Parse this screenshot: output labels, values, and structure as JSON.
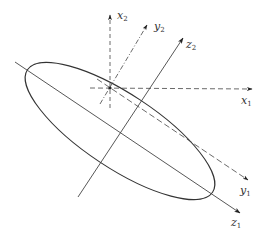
{
  "diagram": {
    "stroke_color": "#333333",
    "background": "#ffffff",
    "axes": {
      "x1": {
        "base": "x",
        "sub": "1",
        "style": "dashed"
      },
      "y1": {
        "base": "y",
        "sub": "1",
        "style": "dashed"
      },
      "z1": {
        "base": "z",
        "sub": "1",
        "style": "solid"
      },
      "x2": {
        "base": "x",
        "sub": "2",
        "style": "dashed"
      },
      "y2": {
        "base": "y",
        "sub": "2",
        "style": "dash-dot"
      },
      "z2": {
        "base": "z",
        "sub": "2",
        "style": "solid"
      }
    }
  }
}
